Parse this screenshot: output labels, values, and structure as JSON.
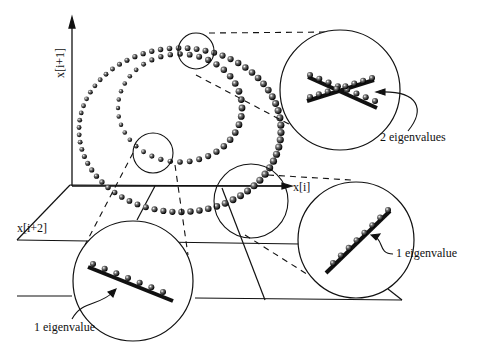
{
  "axes": {
    "y_label": "x[i+1]",
    "x_label": "x[i]",
    "z_label": "x[i+2]"
  },
  "callouts": [
    {
      "id": "top",
      "label": "2 eigenvalues",
      "eigenvalues": 2
    },
    {
      "id": "right",
      "label": "1 eigenvalue",
      "eigenvalues": 1
    },
    {
      "id": "bottom",
      "label": "1 eigenvalue",
      "eigenvalues": 1
    }
  ],
  "colors": {
    "ink": "#111111",
    "background": "#ffffff"
  }
}
